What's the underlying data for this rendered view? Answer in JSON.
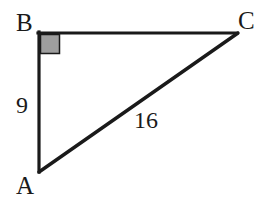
{
  "figure": {
    "kind": "right-triangle-diagram",
    "background_color": "#ffffff",
    "stroke_color": "#1a1a1a",
    "right_angle_fill_color": "#9e9e9e",
    "vertices": {
      "A": {
        "label": "A",
        "x": 39,
        "y": 172
      },
      "B": {
        "label": "B",
        "x": 39,
        "y": 33
      },
      "C": {
        "label": "C",
        "x": 237,
        "y": 33
      }
    },
    "sides": [
      {
        "name": "AB",
        "from": "A",
        "to": "B",
        "length_label": "9",
        "labeled": true
      },
      {
        "name": "BC",
        "from": "B",
        "to": "C",
        "length_label": "",
        "labeled": false
      },
      {
        "name": "AC",
        "from": "A",
        "to": "C",
        "length_label": "16",
        "labeled": true
      }
    ],
    "right_angle": {
      "at_vertex": "B",
      "marker": "filled-square",
      "size": 20
    },
    "labels": {
      "vertex_a": "A",
      "vertex_b": "B",
      "vertex_c": "C",
      "leg_ab_length": "9",
      "hypotenuse_ac_length": "16"
    }
  }
}
